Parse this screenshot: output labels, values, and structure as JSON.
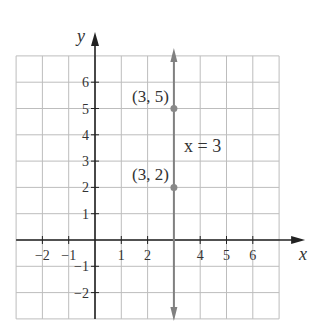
{
  "chart_data": {
    "type": "line",
    "title": "",
    "xlabel": "x",
    "ylabel": "y",
    "xlim": [
      -3,
      7
    ],
    "ylim": [
      -3,
      7
    ],
    "grid": true,
    "x_ticks": [
      -2,
      -1,
      1,
      2,
      4,
      5,
      6
    ],
    "x_tick_labels": [
      "−2",
      "−1",
      "1",
      "2",
      "4",
      "5",
      "6"
    ],
    "y_ticks": [
      -2,
      -1,
      1,
      2,
      3,
      4,
      5,
      6
    ],
    "y_tick_labels": [
      "−2",
      "−1",
      "1",
      "2",
      "3",
      "4",
      "5",
      "6"
    ],
    "series": [
      {
        "name": "x = 3",
        "kind": "vertical-line",
        "x": 3,
        "color": "#808080",
        "arrows": "both"
      }
    ],
    "points": [
      {
        "x": 3,
        "y": 5,
        "label": "(3, 5)"
      },
      {
        "x": 3,
        "y": 2,
        "label": "(3, 2)"
      }
    ],
    "annotations": [
      {
        "text": "x = 3",
        "x": 4.3,
        "y": 3.5
      }
    ]
  },
  "colors": {
    "grid": "#bdbdbd",
    "axis": "#222222",
    "line": "#808080",
    "point": "#888888"
  }
}
